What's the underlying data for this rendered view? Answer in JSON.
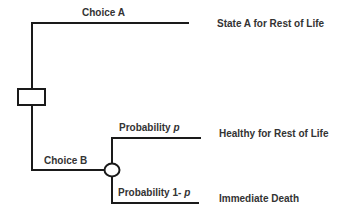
{
  "diagram": {
    "type": "decision-tree",
    "decision_node": {
      "shape": "square"
    },
    "chance_node": {
      "shape": "circle"
    },
    "choices": [
      {
        "label": "Choice A",
        "outcome": "State A for Rest of Life"
      },
      {
        "label": "Choice B",
        "branches": [
          {
            "label_prefix": "Probability ",
            "label_var": "p",
            "outcome": "Healthy for Rest of Life"
          },
          {
            "label_prefix": "Probability 1- ",
            "label_var": "p",
            "outcome": "Immediate Death"
          }
        ]
      }
    ],
    "colors": {
      "line": "#1a1a1a",
      "text": "#333333",
      "background": "#ffffff"
    }
  }
}
